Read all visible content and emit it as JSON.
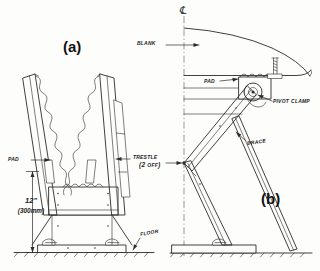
{
  "figure": {
    "background_color": "#fdfdfb",
    "ink_color": "#2b2b2b",
    "width": 320,
    "height": 271
  },
  "labels": {
    "fig_a": "(a)",
    "fig_b": "(b)",
    "pad_left": "PAD",
    "pad_right": "PAD",
    "trestle": "TRESTLE",
    "trestle_qty": "(2 OFF)",
    "floor": "FLOOR",
    "blank": "BLANK",
    "pivot_clamp": "PIVOT CLAMP",
    "brace": "BRACE",
    "centerline_symbol": "℄"
  },
  "dimension": {
    "value_imperial": "12\"",
    "value_metric": "(300mm)"
  }
}
